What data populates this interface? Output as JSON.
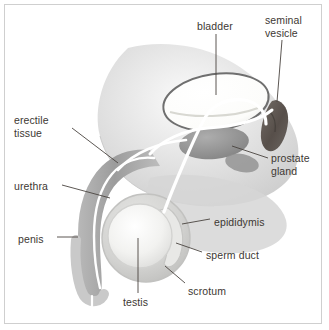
{
  "figure": {
    "border_color": "#cfcfcf",
    "background": "#ffffff",
    "text_color": "#3d3833",
    "leader_line_color": "#4a4440"
  },
  "palette": {
    "body_silhouette": "#dcdcdc",
    "bladder_fill": "#fdfdfb",
    "bladder_outline": "#6f6f6f",
    "prostate_fill": "#9a9a9a",
    "seminal_vesicle_fill": "#5f5954",
    "erectile_tissue_fill": "#a7a7a7",
    "penis_outer_fill": "#c9c9c9",
    "urethra_fill": "#ffffff",
    "scrotum_fill": "#cdcdcd",
    "testis_fill": "#f2f2f0",
    "epididymis_fill": "#e2e2e0",
    "sperm_duct_stroke": "#ffffff"
  },
  "labels": [
    {
      "id": "bladder",
      "text": "bladder",
      "x": 197,
      "y": 20,
      "lines": [
        "bladder"
      ]
    },
    {
      "id": "seminal-vesicle",
      "text": "seminal vesicle",
      "x": 265,
      "y": 14,
      "lines": [
        "seminal",
        "vesicle"
      ]
    },
    {
      "id": "erectile-tissue",
      "text": "erectile tissue",
      "x": 14,
      "y": 114,
      "lines": [
        "erectile",
        "tissue"
      ]
    },
    {
      "id": "prostate-gland",
      "text": "prostate gland",
      "x": 271,
      "y": 152,
      "lines": [
        "prostate",
        "gland"
      ]
    },
    {
      "id": "urethra",
      "text": "urethra",
      "x": 14,
      "y": 180,
      "lines": [
        "urethra"
      ]
    },
    {
      "id": "epididymis",
      "text": "epididymis",
      "x": 214,
      "y": 216,
      "lines": [
        "epididymis"
      ]
    },
    {
      "id": "penis",
      "text": "penis",
      "x": 18,
      "y": 233,
      "lines": [
        "penis"
      ]
    },
    {
      "id": "sperm-duct",
      "text": "sperm duct",
      "x": 206,
      "y": 249,
      "lines": [
        "sperm duct"
      ]
    },
    {
      "id": "scrotum",
      "text": "scrotum",
      "x": 188,
      "y": 285,
      "lines": [
        "scrotum"
      ]
    },
    {
      "id": "testis",
      "text": "testis",
      "x": 123,
      "y": 296,
      "lines": [
        "testis"
      ]
    }
  ],
  "leader_lines": [
    {
      "id": "leader-bladder",
      "from": [
        216,
        34
      ],
      "to": [
        216,
        95
      ]
    },
    {
      "id": "leader-seminal-vesicle",
      "from": [
        282,
        40
      ],
      "to": [
        277,
        102
      ]
    },
    {
      "id": "leader-erectile-tissue",
      "from": [
        72,
        128
      ],
      "to": [
        118,
        163
      ]
    },
    {
      "id": "leader-prostate-gland",
      "from": [
        268,
        158
      ],
      "to": [
        232,
        146
      ]
    },
    {
      "id": "leader-urethra",
      "from": [
        62,
        185
      ],
      "to": [
        110,
        198
      ]
    },
    {
      "id": "leader-epididymis",
      "from": [
        210,
        219
      ],
      "to": [
        182,
        224
      ]
    },
    {
      "id": "leader-penis",
      "from": [
        57,
        237
      ],
      "to": [
        78,
        237
      ]
    },
    {
      "id": "leader-sperm-duct",
      "from": [
        202,
        252
      ],
      "to": [
        176,
        243
      ]
    },
    {
      "id": "leader-scrotum",
      "from": [
        185,
        283
      ],
      "to": [
        165,
        266
      ]
    },
    {
      "id": "leader-testis",
      "from": [
        138,
        293
      ],
      "to": [
        138,
        238
      ]
    }
  ]
}
